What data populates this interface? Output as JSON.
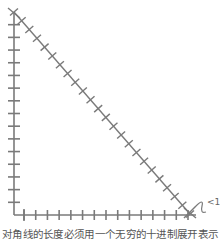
{
  "diagram": {
    "stroke_color": "#7a7a7a",
    "vertical_leg": {
      "x": 14,
      "y_top": 12,
      "y_bottom": 215,
      "tick_count": 16
    },
    "horizontal_leg": {
      "y": 215,
      "x_left": 14,
      "x_right": 196,
      "tick_count": 15
    },
    "diagonal": {
      "from": [
        14,
        12
      ],
      "to": [
        190,
        214
      ],
      "tick_count": 23
    },
    "annotation": {
      "label": "<1"
    }
  },
  "caption": "对角线的长度必须用一个无穷的十进制展开表示"
}
